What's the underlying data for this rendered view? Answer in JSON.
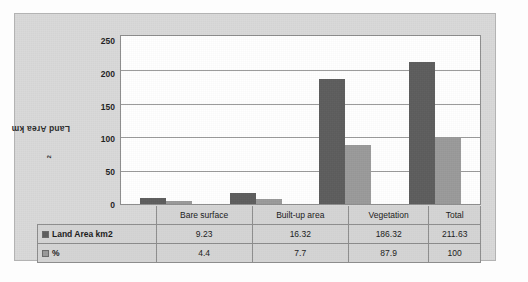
{
  "chart_data": {
    "type": "bar",
    "title": "",
    "xlabel": "",
    "ylabel": "Land Area km2",
    "ylabel_base": "Land Area km",
    "ylabel_sup": "2",
    "categories": [
      "Bare surface",
      "Built-up area",
      "Vegetation",
      "Total"
    ],
    "series": [
      {
        "name": "Land Area km2",
        "color": "#5d5d5d",
        "values": [
          9.23,
          16.32,
          186.32,
          211.63
        ]
      },
      {
        "name": "%",
        "color": "#9a9a9a",
        "values": [
          4.4,
          7.7,
          87.9,
          100
        ]
      }
    ],
    "ylim": [
      0,
      250
    ],
    "yticks": [
      0,
      50,
      100,
      150,
      200,
      250
    ],
    "yticklabels": [
      "0",
      "50",
      "100",
      "150",
      "200",
      "250"
    ],
    "grid": true,
    "legend_position": "data-table-left",
    "data_table": {
      "row_labels": [
        "Land Area km2",
        "%"
      ],
      "rows": [
        [
          "9.23",
          "16.32",
          "186.32",
          "211.63"
        ],
        [
          "4.4",
          "7.7",
          "87.9",
          "100"
        ]
      ]
    }
  },
  "colors": {
    "series1": "#5d5d5d",
    "series2": "#9a9a9a",
    "card_background": "#d9d9d9",
    "plot_background": "#ffffff",
    "gridline": "#9b9b9b",
    "table_fill": "#d4d4d4",
    "border": "#8d8d8d"
  }
}
